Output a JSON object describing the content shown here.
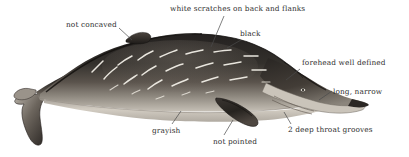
{
  "figure": {
    "palette": {
      "body_dark": "#2b2724",
      "body_mid": "#4a443f",
      "body_light_gray": "#9b958d",
      "belly": "#cfc9bf",
      "scratch_white": "#f4f1ea",
      "outline": "#1b1917",
      "label_text": "#2e2e2e",
      "leader_line": "#4a4a4a",
      "background": "#ffffff"
    },
    "leader_lines": [
      {
        "name": "leader-scratches",
        "x1": 224,
        "y1": 16,
        "x2": 211,
        "y2": 47
      },
      {
        "name": "leader-not-concaved",
        "x1": 118,
        "y1": 29,
        "x2": 130,
        "y2": 39
      },
      {
        "name": "leader-black",
        "x1": 242,
        "y1": 40,
        "x2": 228,
        "y2": 47
      },
      {
        "name": "leader-forehead",
        "x1": 300,
        "y1": 69,
        "x2": 287,
        "y2": 80
      },
      {
        "name": "leader-long-narrow",
        "x1": 332,
        "y1": 91,
        "x2": 320,
        "y2": 99
      },
      {
        "name": "leader-grayish",
        "x1": 172,
        "y1": 124,
        "x2": 180,
        "y2": 112
      },
      {
        "name": "leader-not-pointed",
        "x1": 224,
        "y1": 135,
        "x2": 232,
        "y2": 120
      },
      {
        "name": "leader-throat-grooves",
        "x1": 291,
        "y1": 124,
        "x2": 283,
        "y2": 113
      }
    ]
  },
  "labels": {
    "scratches": "white scratches on back and flanks",
    "not_concaved": "not concaved",
    "black": "black",
    "forehead": "forehead well defined",
    "long_narrow": "long, narrow",
    "grayish": "grayish",
    "not_pointed": "not pointed",
    "throat_grooves": "2 deep throat grooves"
  }
}
